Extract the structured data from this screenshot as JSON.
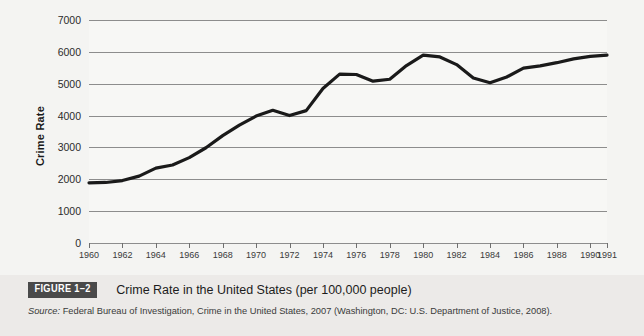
{
  "figure": {
    "badge": "FIGURE 1–2",
    "title": "Crime Rate in the United States (per 100,000 people)",
    "source_prefix": "Source:",
    "source_text": " Federal Bureau of Investigation, Crime in the United States, 2007 (Washington, DC: U.S. Department of Justice, 2008)."
  },
  "colors": {
    "background": "#f4f4f2",
    "plot_background": "#f7f7f5",
    "gridline": "#8d8d8d",
    "series": "#1a1a1a",
    "badge_background": "#4a4a4a",
    "badge_text": "#ffffff",
    "caption_background": "#eceae8"
  },
  "chart_data": {
    "type": "line",
    "title": "Crime Rate in the United States (per 100,000 people)",
    "xlabel": "",
    "ylabel": "Crime Rate",
    "ylim": [
      0,
      7000
    ],
    "xlim": [
      1960,
      1991
    ],
    "grid": true,
    "legend": "none",
    "ytick_labels": [
      "0",
      "1000",
      "2000",
      "3000",
      "4000",
      "5000",
      "6000",
      "7000"
    ],
    "yticks": [
      0,
      1000,
      2000,
      3000,
      4000,
      5000,
      6000,
      7000
    ],
    "xtick_labels": [
      "1960",
      "1962",
      "1964",
      "1966",
      "1968",
      "1970",
      "1972",
      "1974",
      "1976",
      "1978",
      "1980",
      "1982",
      "1984",
      "1986",
      "1988",
      "1990",
      "1991"
    ],
    "xticks": [
      1960,
      1962,
      1964,
      1966,
      1968,
      1970,
      1972,
      1974,
      1976,
      1978,
      1980,
      1982,
      1984,
      1986,
      1988,
      1990,
      1991
    ],
    "series": [
      {
        "name": "Crime Rate",
        "x": [
          1960,
          1961,
          1962,
          1963,
          1964,
          1965,
          1966,
          1967,
          1968,
          1969,
          1970,
          1971,
          1972,
          1973,
          1974,
          1975,
          1976,
          1977,
          1978,
          1979,
          1980,
          1981,
          1982,
          1983,
          1984,
          1985,
          1986,
          1987,
          1988,
          1989,
          1990,
          1991
        ],
        "values": [
          1890,
          1900,
          1960,
          2100,
          2350,
          2450,
          2680,
          2990,
          3370,
          3700,
          3985,
          4165,
          4000,
          4155,
          4850,
          5300,
          5290,
          5080,
          5140,
          5570,
          5900,
          5840,
          5600,
          5180,
          5030,
          5210,
          5490,
          5560,
          5660,
          5780,
          5860,
          5900
        ]
      }
    ]
  }
}
